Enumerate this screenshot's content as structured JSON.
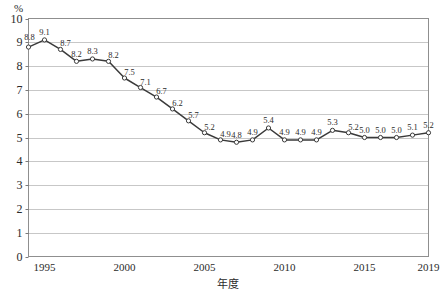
{
  "chart_data": {
    "type": "line",
    "title": "",
    "xlabel": "年度",
    "ylabel": "",
    "unit_label": "%",
    "xlim": [
      1994,
      2019
    ],
    "ylim": [
      0,
      10
    ],
    "grid": true,
    "legend": false,
    "y_ticks": [
      "0",
      "1",
      "2",
      "3",
      "4",
      "5",
      "6",
      "7",
      "8",
      "9",
      "10"
    ],
    "x_ticks": [
      "1995",
      "2000",
      "2005",
      "2010",
      "2015",
      "2019"
    ],
    "x_tick_values": [
      1995,
      2000,
      2005,
      2010,
      2015,
      2019
    ],
    "x": [
      1994,
      1995,
      1996,
      1997,
      1998,
      1999,
      2000,
      2001,
      2002,
      2003,
      2004,
      2005,
      2006,
      2007,
      2008,
      2009,
      2010,
      2011,
      2012,
      2013,
      2014,
      2015,
      2016,
      2017,
      2018,
      2019
    ],
    "values": [
      8.8,
      9.1,
      8.7,
      8.2,
      8.3,
      8.2,
      7.5,
      7.1,
      6.7,
      6.2,
      5.7,
      5.2,
      4.9,
      4.8,
      4.9,
      5.4,
      4.9,
      4.9,
      4.9,
      5.3,
      5.2,
      5.0,
      5.0,
      5.0,
      5.1,
      5.2
    ],
    "point_labels": [
      "8.8",
      "9.1",
      "8.7",
      "8.2",
      "8.3",
      "8.2",
      "7.5",
      "7.1",
      "6.7",
      "6.2",
      "5.7",
      "5.2",
      "4.9",
      "4.8",
      "4.9",
      "5.4",
      "4.9",
      "4.9",
      "4.9",
      "5.3",
      "5.2",
      "5.0",
      "5.0",
      "5.0",
      "5.1",
      "5.2"
    ],
    "series": [
      {
        "name": "",
        "values": [
          8.8,
          9.1,
          8.7,
          8.2,
          8.3,
          8.2,
          7.5,
          7.1,
          6.7,
          6.2,
          5.7,
          5.2,
          4.9,
          4.8,
          4.9,
          5.4,
          4.9,
          4.9,
          4.9,
          5.3,
          5.2,
          5.0,
          5.0,
          5.0,
          5.1,
          5.2
        ],
        "color": "#3a3a3a",
        "marker": "open-circle"
      }
    ],
    "colors": {
      "line": "#3a3a3a",
      "marker_fill": "#ffffff",
      "gridline": "#b9b9b9",
      "frame": "#8f8f8f",
      "text": "#2b2b2b",
      "background": "#ffffff"
    }
  }
}
